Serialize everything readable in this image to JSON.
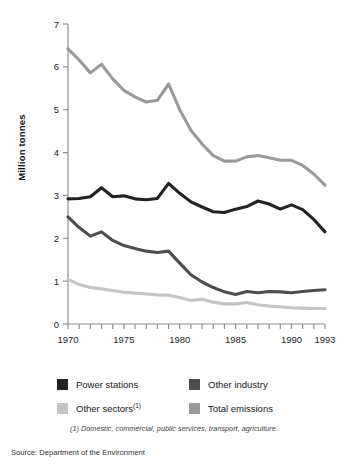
{
  "figure": {
    "axis_title": "Million tonnes",
    "footnote": "(1) Domestic, commercial, public services, transport, agriculture.",
    "source": "Source: Department of the Environment"
  },
  "legend": {
    "items": [
      {
        "label": "Power stations",
        "label_sup": "",
        "color": "#222222",
        "series_key": "power_stations"
      },
      {
        "label": "Other industry",
        "label_sup": "",
        "color": "#4d4d4d",
        "series_key": "other_industry"
      },
      {
        "label": "Other sectors",
        "label_sup": "(1)",
        "color": "#c4c4c4",
        "series_key": "other_sectors"
      },
      {
        "label": "Total emissions",
        "label_sup": "",
        "color": "#9a9a9a",
        "series_key": "total_emissions"
      }
    ]
  },
  "chart_data": {
    "type": "line",
    "title": "",
    "subtitle": "",
    "xlabel": "",
    "ylabel": "Million tonnes",
    "xlim": [
      1970,
      1993
    ],
    "ylim": [
      0,
      7
    ],
    "yticks": [
      0,
      1,
      2,
      3,
      4,
      5,
      6,
      7
    ],
    "ytick_labels": [
      "0",
      "1",
      "2",
      "3",
      "4",
      "5",
      "6",
      "7"
    ],
    "xticks": [
      1970,
      1971,
      1972,
      1973,
      1974,
      1975,
      1976,
      1977,
      1978,
      1979,
      1980,
      1981,
      1982,
      1983,
      1984,
      1985,
      1986,
      1987,
      1988,
      1989,
      1990,
      1991,
      1992,
      1993
    ],
    "xtick_labels_shown": [
      "1970",
      "1975",
      "1980",
      "1985",
      "1990",
      "1993"
    ],
    "xtick_labels_shown_at": [
      1970,
      1975,
      1980,
      1985,
      1990,
      1993
    ],
    "grid": false,
    "legend_position": "below",
    "x": [
      1970,
      1971,
      1972,
      1973,
      1974,
      1975,
      1976,
      1977,
      1978,
      1979,
      1980,
      1981,
      1982,
      1983,
      1984,
      1985,
      1986,
      1987,
      1988,
      1989,
      1990,
      1991,
      1992,
      1993
    ],
    "series": [
      {
        "name": "Total emissions",
        "color": "#9a9a9a",
        "values": [
          6.42,
          6.16,
          5.86,
          6.06,
          5.72,
          5.45,
          5.3,
          5.18,
          5.22,
          5.6,
          5.0,
          4.52,
          4.2,
          3.93,
          3.8,
          3.8,
          3.9,
          3.93,
          3.88,
          3.82,
          3.82,
          3.7,
          3.5,
          3.24
        ]
      },
      {
        "name": "Power stations",
        "color": "#222222",
        "values": [
          2.92,
          2.93,
          2.97,
          3.18,
          2.97,
          2.99,
          2.92,
          2.9,
          2.93,
          3.28,
          3.05,
          2.85,
          2.73,
          2.62,
          2.6,
          2.68,
          2.74,
          2.87,
          2.8,
          2.68,
          2.78,
          2.67,
          2.44,
          2.15
        ]
      },
      {
        "name": "Other industry",
        "color": "#4d4d4d",
        "values": [
          2.5,
          2.25,
          2.05,
          2.15,
          1.95,
          1.83,
          1.76,
          1.7,
          1.67,
          1.7,
          1.42,
          1.15,
          0.98,
          0.85,
          0.75,
          0.69,
          0.76,
          0.73,
          0.76,
          0.75,
          0.73,
          0.76,
          0.78,
          0.8
        ]
      },
      {
        "name": "Other sectors",
        "color": "#c4c4c4",
        "values": [
          1.04,
          0.92,
          0.85,
          0.82,
          0.78,
          0.74,
          0.72,
          0.7,
          0.68,
          0.67,
          0.62,
          0.55,
          0.58,
          0.51,
          0.47,
          0.47,
          0.5,
          0.45,
          0.42,
          0.4,
          0.38,
          0.37,
          0.36,
          0.36
        ]
      }
    ]
  },
  "axes_pixels": {
    "x0": 68,
    "x1": 325,
    "y0": 324,
    "y1": 24,
    "axis_color": "#8f8f8f"
  }
}
